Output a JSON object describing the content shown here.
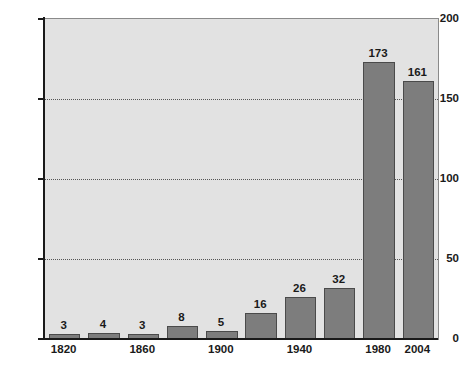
{
  "chart_data": {
    "type": "bar",
    "title": "",
    "subtitle": "",
    "xlabel": "",
    "ylabel": "",
    "categories": [
      "1820",
      "1840",
      "1860",
      "1880",
      "1900",
      "1920",
      "1940",
      "1960",
      "1980",
      "2004"
    ],
    "values": [
      3,
      4,
      3,
      8,
      5,
      16,
      26,
      32,
      173,
      161
    ],
    "data_labels": [
      "3",
      "4",
      "3",
      "8",
      "5",
      "16",
      "26",
      "32",
      "173",
      "161"
    ],
    "visible_tick_labels": [
      "1820",
      "1860",
      "1900",
      "1940",
      "1980",
      "2004"
    ],
    "visible_tick_indices": [
      0,
      2,
      4,
      6,
      8,
      9
    ],
    "ylim": [
      0,
      200
    ],
    "yticks": [
      0,
      50,
      100,
      150,
      200
    ],
    "ytick_labels": [
      "0",
      "50",
      "100",
      "150",
      "200"
    ],
    "grid": true,
    "grid_axis": "y",
    "grid_style": "dotted",
    "legend": null,
    "legend_position": "none",
    "colors": {
      "bar_fill": "#7d7d7d",
      "bar_edge": "#4a4a4a",
      "plot_background": "#e2e2e2",
      "plot_border": "#8a8a8a",
      "axis": "#1a1a1a",
      "gridline": "#555555",
      "text": "#1a1a1a",
      "page_background": "#ffffff"
    }
  }
}
